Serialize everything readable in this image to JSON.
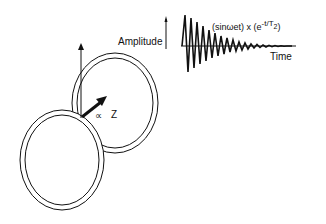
{
  "diagram": {
    "labels": {
      "amplitude": "Amplitude",
      "time": "Time",
      "formula_main": "(sinωet) x (e",
      "formula_exp": "-t/T",
      "formula_sub": "2",
      "formula_close": ")",
      "alpha": "∝",
      "z": "Z"
    },
    "colors": {
      "ink": "#111111",
      "background": "#ffffff"
    }
  }
}
